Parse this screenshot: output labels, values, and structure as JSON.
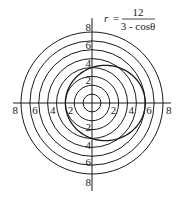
{
  "chart_data": {
    "type": "line",
    "subtype": "polar",
    "title": "",
    "equation": {
      "lhs": "r",
      "equals": "=",
      "numerator": "12",
      "denominator": "3 - cosθ"
    },
    "curve": {
      "name": "r = 12/(3 - cos θ)",
      "numerator": 12,
      "a": 3,
      "b": -1,
      "theta_range": [
        0,
        6.2832
      ]
    },
    "rings": [
      1,
      2,
      3,
      4,
      5,
      6,
      7,
      8
    ],
    "rlim": [
      0,
      8
    ],
    "tick_labels": {
      "up": [
        "2",
        "4",
        "6",
        "8"
      ],
      "down": [
        "2",
        "4",
        "6",
        "8"
      ],
      "left": [
        "2",
        "4",
        "6",
        "8"
      ],
      "right": [
        "2",
        "4",
        "6",
        "8"
      ]
    },
    "tick_values": [
      2,
      4,
      6,
      8
    ],
    "colors": {
      "ink": "#1a1a1a",
      "background": "#ffffff"
    },
    "grid": true,
    "legend": "none"
  }
}
